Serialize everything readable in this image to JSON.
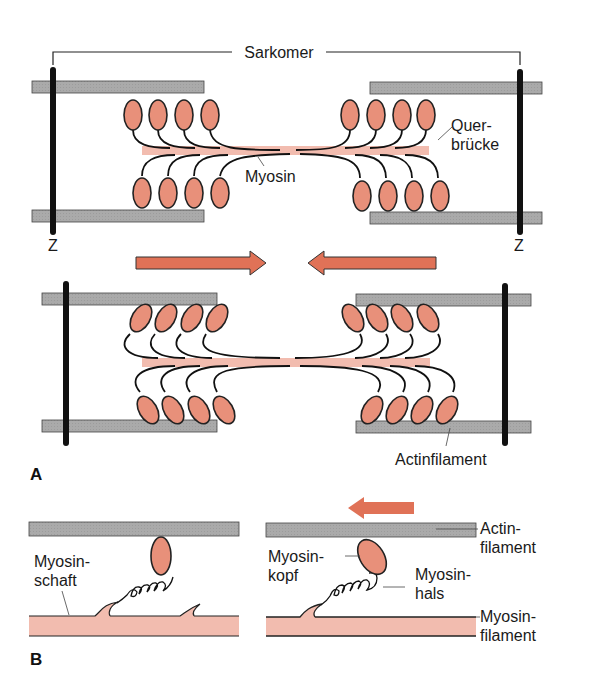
{
  "figure": {
    "panel_a": {
      "letter": "A",
      "sarcomere_label": "Sarkomer",
      "z_left": "Z",
      "z_right": "Z",
      "crossbridge_label_line1": "Quer-",
      "crossbridge_label_line2": "brücke",
      "myosin_label": "Myosin",
      "actin_label": "Actinfilament"
    },
    "panel_b": {
      "letter": "B",
      "shaft_line1": "Myosin-",
      "shaft_line2": "schaft",
      "head_line1": "Myosin-",
      "head_line2": "kopf",
      "neck_line1": "Myosin-",
      "neck_line2": "hals",
      "actin_line1": "Actin-",
      "actin_line2": "filament",
      "myosin_fil_line1": "Myosin-",
      "myosin_fil_line2": "filament"
    }
  },
  "colors": {
    "actin": "#a9a9a9",
    "myosin_head": "#e8907a",
    "myosin_shaft": "#f2bcaf",
    "arrow": "#e07257",
    "z_line": "#111111"
  }
}
